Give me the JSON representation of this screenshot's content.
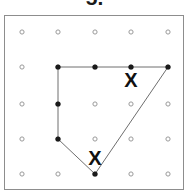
{
  "item": {
    "number_label": "5."
  },
  "figure": {
    "frame": {
      "x": 4,
      "y": 15,
      "width": 180,
      "height": 175,
      "border_color": "#8d8d8d"
    },
    "background": "#ffffff",
    "grid": {
      "rows": 5,
      "cols": 5,
      "peg_color": "#9a9a9a",
      "peg_radius": 2.1,
      "x_positions": [
        17,
        53,
        90,
        126,
        163
      ],
      "y_positions": [
        16,
        51,
        88,
        123,
        158
      ]
    },
    "polygon": {
      "stroke_color": "#6e6e6e",
      "stroke_width": 1,
      "fill": "none",
      "vertices": [
        {
          "label": "top-left",
          "x": 53,
          "y": 51,
          "grid_col": 2,
          "grid_row": 2
        },
        {
          "label": "top-right",
          "x": 163,
          "y": 51,
          "grid_col": 5,
          "grid_row": 2
        },
        {
          "label": "bottom-apex",
          "x": 90,
          "y": 158,
          "grid_col": 3,
          "grid_row": 5
        },
        {
          "label": "left-lower",
          "x": 53,
          "y": 123,
          "grid_col": 2,
          "grid_row": 4
        }
      ],
      "edge_lattice_dots": [
        {
          "x": 90,
          "y": 51
        },
        {
          "x": 126,
          "y": 51
        },
        {
          "x": 53,
          "y": 88
        }
      ],
      "vertex_dot_color": "#1a1a1a",
      "vertex_dot_radius": 2.6
    },
    "markers": [
      {
        "name": "x-mark-upper",
        "symbol": "X",
        "x": 126,
        "y": 64
      },
      {
        "name": "x-mark-lower",
        "symbol": "X",
        "x": 90,
        "y": 142
      }
    ]
  }
}
